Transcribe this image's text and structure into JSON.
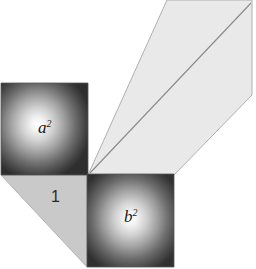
{
  "figure": {
    "background_color": "#ffffff",
    "width": 256,
    "height": 269
  },
  "labels": {
    "square_a": {
      "base": "a",
      "exponent": "2",
      "full": "a²"
    },
    "square_b": {
      "base": "b",
      "exponent": "2",
      "full": "b²"
    },
    "triangle": {
      "text": "1"
    }
  },
  "shapes": {
    "square_a": {
      "name": "a-squared-square",
      "points": "1,83 88,83 88,175 1,175",
      "fill_style": "radial-gradient",
      "center_color": "#f8f8f8",
      "edge_color": "#2b2b2b",
      "stroke_color": "#555555"
    },
    "square_b": {
      "name": "b-squared-square",
      "points": "87,174 174,174 174,267 87,267",
      "fill_style": "radial-gradient",
      "center_color": "#f8f8f8",
      "edge_color": "#2b2b2b",
      "stroke_color": "#555555"
    },
    "triangle": {
      "name": "unit-triangle",
      "points": "1,175 87,175 87,267",
      "fill_color": "#c9c9c9",
      "stroke_color": "#b4b4b4"
    },
    "parallelogram": {
      "name": "parallelogram-region",
      "points": "88,175 167,0 252,0 252,95 174,175",
      "fill_color": "#e9e9e9",
      "stroke_color": "#b0b0b0"
    },
    "diagonal": {
      "name": "parallelogram-diagonal",
      "x1": 90,
      "y1": 173,
      "x2": 251,
      "y2": 3,
      "stroke_color": "#8a8a8a"
    }
  }
}
